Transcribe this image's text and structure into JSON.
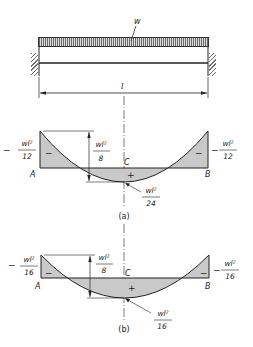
{
  "beam": {
    "load_label": "w",
    "span_label": "l",
    "support_type": "fixed-fixed"
  },
  "diagram_a": {
    "caption": "(a)",
    "left_support": "A",
    "right_support": "B",
    "center_point": "C",
    "end_moment_left": {
      "sign": "−",
      "num": "wl²",
      "den": "12"
    },
    "end_moment_right": {
      "sign": "−",
      "num": "wl²",
      "den": "12"
    },
    "simple_span_moment": {
      "num": "wl²",
      "den": "8"
    },
    "midspan_moment": {
      "num": "wl²",
      "den": "24"
    },
    "neg_region_sign": "−",
    "pos_region_sign": "+"
  },
  "diagram_b": {
    "caption": "(b)",
    "left_support": "A",
    "right_support": "B",
    "center_point": "C",
    "end_moment_left": {
      "sign": "−",
      "num": "wl²",
      "den": "16"
    },
    "end_moment_right": {
      "sign": "−",
      "num": "wl²",
      "den": "16"
    },
    "simple_span_moment": {
      "num": "wl²",
      "den": "8"
    },
    "midspan_moment": {
      "num": "wl²",
      "den": "16"
    },
    "neg_region_sign": "−",
    "pos_region_sign": "+"
  },
  "colors": {
    "line": "#222222",
    "shade": "#c9c9c9",
    "background": "#ffffff"
  }
}
